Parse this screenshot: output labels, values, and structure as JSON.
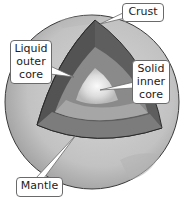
{
  "diagram": {
    "colors": {
      "globe_surface": "#c8c8c8",
      "crust_edge": "#3a3a3a",
      "mantle": "#6e6e6e",
      "mantle_lower": "#9a9a9a",
      "outer_core": "#8c8c8c",
      "outer_core_light": "#b4b4b4",
      "inner_core": "#e8e8e8",
      "label_border": "#6a6a6a",
      "label_text": "#222222"
    },
    "labels": {
      "crust": {
        "lines": [
          "Crust"
        ]
      },
      "liquid_outer_core": {
        "lines": [
          "Liquid",
          "outer",
          "core"
        ]
      },
      "solid_inner_core": {
        "lines": [
          "Solid",
          "inner",
          "core"
        ]
      },
      "mantle": {
        "lines": [
          "Mantle"
        ]
      }
    }
  }
}
